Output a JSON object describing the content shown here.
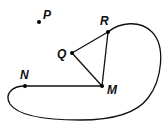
{
  "diagram": {
    "type": "geometry-graph",
    "colors": {
      "stroke": "#111111",
      "background": "#ffffff"
    },
    "points": [
      {
        "id": "P",
        "label": "P",
        "x": 39,
        "y": 22,
        "lx": 43,
        "ly": 19
      },
      {
        "id": "R",
        "label": "R",
        "x": 108,
        "y": 32,
        "lx": 100,
        "ly": 25
      },
      {
        "id": "Q",
        "label": "Q",
        "x": 72,
        "y": 53,
        "lx": 57,
        "ly": 58
      },
      {
        "id": "M",
        "label": "M",
        "x": 102,
        "y": 86,
        "lx": 107,
        "ly": 94
      },
      {
        "id": "N",
        "label": "N",
        "x": 25,
        "y": 86,
        "lx": 20,
        "ly": 79
      }
    ],
    "segments": [
      {
        "from": "Q",
        "to": "R"
      },
      {
        "from": "Q",
        "to": "M"
      },
      {
        "from": "R",
        "to": "M"
      },
      {
        "from": "N",
        "to": "M"
      }
    ],
    "curves": [
      {
        "from": "R",
        "to": "N",
        "description": "closed-loop curve from R around the right and bottom back to N"
      }
    ]
  }
}
